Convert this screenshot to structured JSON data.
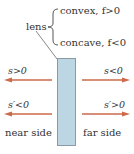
{
  "diagram": {
    "lens_label": "lens",
    "convex_label": "convex, f>0",
    "concave_label": "concave, f<0",
    "top_left_label": "s>0",
    "top_right_label": "s<0",
    "bottom_left_label": "s′<0",
    "bottom_right_label": "s′>0",
    "near_side_label": "near side",
    "far_side_label": "far side",
    "colors": {
      "lens_fill": "#bcd6e4",
      "lens_border": "#8a9aa4",
      "arrow": "#cc6a4a",
      "text": "#333333"
    }
  }
}
